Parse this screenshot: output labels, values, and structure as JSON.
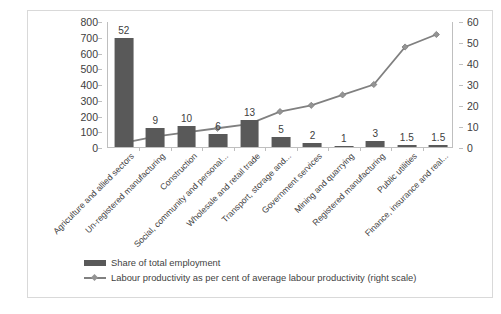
{
  "chart_data": {
    "type": "bar",
    "title": "",
    "subtitle": "",
    "xlabel": "",
    "ylabel": "",
    "grid": false,
    "legend_position": "bottom",
    "categories": [
      "Agriculture and allied sectors",
      "Un-registered manufacturing",
      "Construction",
      "Social, community and personal...",
      "Wholesale and retail trade",
      "Transport, storage and...",
      "Government services",
      "Mining and quarrying",
      "Registered manufacturing",
      "Public utilities",
      "Finance, insurance and real..."
    ],
    "series": [
      {
        "name": "Share of total employment",
        "type": "bar",
        "axis": "left",
        "color": "#595959",
        "values": [
          690,
          118,
          132,
          80,
          172,
          65,
          25,
          8,
          40,
          15,
          15
        ],
        "data_labels": [
          "52",
          "9",
          "10",
          "6",
          "13",
          "5",
          "2",
          "1",
          "3",
          "1.5",
          "1.5"
        ]
      },
      {
        "name": "Labour productivity as per cent of average labour productivity (right scale)",
        "type": "line",
        "axis": "right",
        "color": "#808080",
        "values": [
          2,
          5,
          7,
          9,
          11,
          17,
          20,
          25,
          30,
          48,
          54
        ]
      }
    ],
    "left_axis": {
      "ylim": [
        0,
        800
      ],
      "ticks": [
        "0",
        "100",
        "200",
        "300",
        "400",
        "500",
        "600",
        "700",
        "800"
      ]
    },
    "right_axis": {
      "ylim": [
        0,
        60
      ],
      "ticks": [
        "0",
        "10",
        "20",
        "30",
        "40",
        "50",
        "60"
      ]
    }
  },
  "legend": {
    "items": [
      {
        "label": "Share of total employment",
        "marker": "bar-swatch"
      },
      {
        "label": "Labour productivity as per cent of average labour productivity (right scale)",
        "marker": "line-diamond-swatch"
      }
    ]
  },
  "caption": {
    "text": ""
  }
}
